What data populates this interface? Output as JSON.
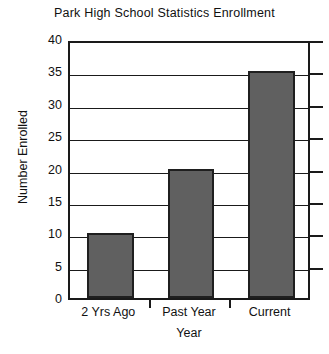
{
  "chart_data": {
    "type": "bar",
    "title": "Park High School Statistics Enrollment",
    "xlabel": "Year",
    "ylabel": "Number Enrolled",
    "categories": [
      "2 Yrs Ago",
      "Past Year",
      "Current"
    ],
    "values": [
      10,
      20,
      35
    ],
    "ylim": [
      0,
      40
    ],
    "ytick_labels": [
      "0",
      "5",
      "10",
      "15",
      "20",
      "25",
      "30",
      "35",
      "40"
    ],
    "ytick_values": [
      0,
      5,
      10,
      15,
      20,
      25,
      30,
      35,
      40
    ],
    "grid": true,
    "legend": false,
    "bar_color": "#606060",
    "bar_edge_color": "#1f1f1f",
    "axis_color": "#1a1a1a",
    "background_color": "#ffffff"
  }
}
